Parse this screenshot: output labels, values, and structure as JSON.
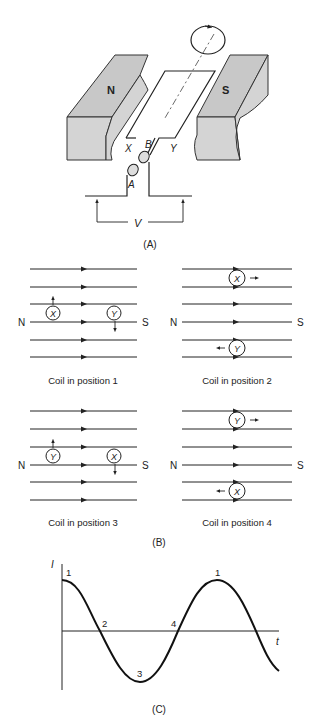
{
  "panel_a": {
    "label": "(A)",
    "north_pole": "N",
    "south_pole": "S",
    "coil_side_x": "X",
    "coil_side_y": "Y",
    "slip_ring_a": "A",
    "slip_ring_b": "B",
    "voltage": "V"
  },
  "panel_b": {
    "label": "(B)",
    "positions": [
      {
        "caption": "Coil in position 1",
        "north": "N",
        "south": "S",
        "left_conductor": "X",
        "right_conductor": "Y"
      },
      {
        "caption": "Coil in position 2",
        "north": "N",
        "south": "S",
        "top_conductor": "X",
        "bottom_conductor": "Y"
      },
      {
        "caption": "Coil in position 3",
        "north": "N",
        "south": "S",
        "left_conductor": "Y",
        "right_conductor": "X"
      },
      {
        "caption": "Coil in position 4",
        "north": "N",
        "south": "S",
        "top_conductor": "Y",
        "bottom_conductor": "X"
      }
    ]
  },
  "panel_c": {
    "label": "(C)",
    "y_axis": "I",
    "x_axis": "t",
    "points": [
      "1",
      "2",
      "3",
      "4",
      "1"
    ]
  }
}
